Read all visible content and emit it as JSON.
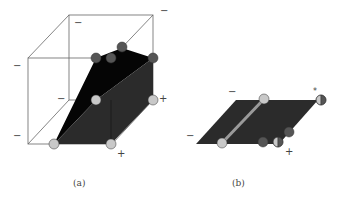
{
  "panels": [
    {
      "caption": "(a)",
      "signs": {
        "top_right": "−",
        "back_top_left": "−",
        "front_left_upper": "−",
        "middle_left": "−",
        "front_left_lower": "−",
        "right_mid": "+",
        "bottom_right": "+"
      }
    },
    {
      "caption": "(b)",
      "signs": {
        "top": "−",
        "left": "−",
        "top_right": "*",
        "bottom_right": "+"
      }
    }
  ],
  "colors": {
    "black_face": "#050505",
    "dark_face": "#2b2b2b",
    "light_node": "#c8c8c8",
    "dark_node": "#555555",
    "edge": "#555555",
    "segment": "#9a9a9a"
  }
}
